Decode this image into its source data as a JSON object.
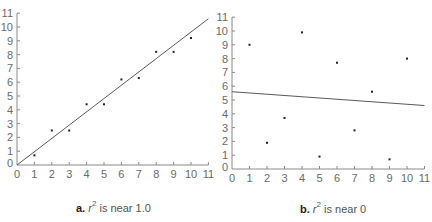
{
  "chart_data": [
    {
      "type": "scatter",
      "panel_label": "a.",
      "caption_text": "is near 1.0",
      "caption_symbol": "r",
      "caption_exponent": "2",
      "x_ticks": [
        "0",
        "1",
        "2",
        "3",
        "4",
        "5",
        "6",
        "7",
        "8",
        "9",
        "10",
        "11"
      ],
      "y_ticks": [
        "0",
        "1",
        "2",
        "3",
        "4",
        "5",
        "6",
        "7",
        "8",
        "9",
        "10",
        "11"
      ],
      "xlim": [
        0,
        11
      ],
      "ylim": [
        0,
        11
      ],
      "grid": false,
      "points": [
        {
          "x": 1,
          "y": 0.7
        },
        {
          "x": 2,
          "y": 2.5
        },
        {
          "x": 3,
          "y": 2.5
        },
        {
          "x": 4,
          "y": 4.4
        },
        {
          "x": 5,
          "y": 4.4
        },
        {
          "x": 6,
          "y": 6.2
        },
        {
          "x": 7,
          "y": 6.3
        },
        {
          "x": 8,
          "y": 8.2
        },
        {
          "x": 9,
          "y": 8.2
        },
        {
          "x": 10,
          "y": 9.2
        }
      ],
      "regression_line": {
        "x1": 0,
        "y1": 0,
        "x2": 11,
        "y2": 10.6
      }
    },
    {
      "type": "scatter",
      "panel_label": "b.",
      "caption_text": "is near 0",
      "caption_symbol": "r",
      "caption_exponent": "2",
      "x_ticks": [
        "0",
        "1",
        "2",
        "3",
        "4",
        "5",
        "6",
        "7",
        "8",
        "9",
        "10",
        "11"
      ],
      "y_ticks": [
        "0",
        "1",
        "2",
        "3",
        "4",
        "5",
        "6",
        "7",
        "8",
        "9",
        "10",
        "11"
      ],
      "xlim": [
        0,
        11
      ],
      "ylim": [
        0,
        11
      ],
      "grid": false,
      "points": [
        {
          "x": 1,
          "y": 9.0
        },
        {
          "x": 2,
          "y": 1.9
        },
        {
          "x": 3,
          "y": 3.7
        },
        {
          "x": 4,
          "y": 9.9
        },
        {
          "x": 5,
          "y": 0.9
        },
        {
          "x": 6,
          "y": 7.7
        },
        {
          "x": 7,
          "y": 2.8
        },
        {
          "x": 8,
          "y": 5.6
        },
        {
          "x": 9,
          "y": 0.7
        },
        {
          "x": 10,
          "y": 8.0
        }
      ],
      "regression_line": {
        "x1": 0,
        "y1": 5.6,
        "x2": 11,
        "y2": 4.6
      }
    }
  ],
  "captions": {
    "a": {
      "label": "a.",
      "symbol": "r",
      "exponent": "2",
      "text": "is near 1.0"
    },
    "b": {
      "label": "b.",
      "symbol": "r",
      "exponent": "2",
      "text": "is near 0"
    }
  },
  "colors": {
    "axis": "#8a8a8a",
    "line": "#5a5a5a",
    "point": "#222222",
    "tick_label": "#6a6a6a"
  }
}
